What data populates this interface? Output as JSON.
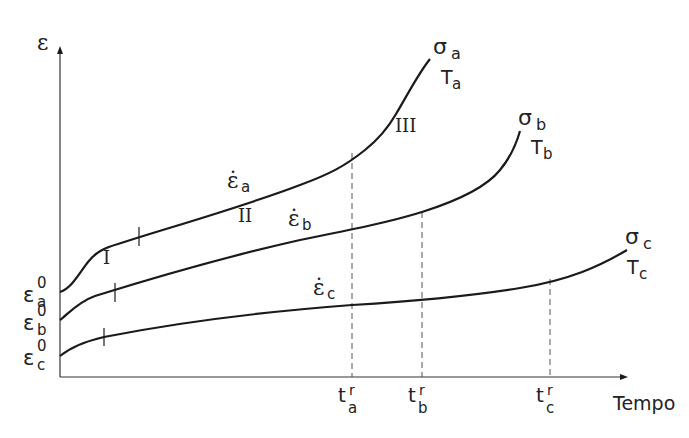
{
  "axes": {
    "y_label": "ε",
    "x_label": "Tempo"
  },
  "curves": [
    {
      "id": "a",
      "stress_label": "σ",
      "stress_sub": "a",
      "temp_label": "T",
      "temp_sub": "a",
      "initial_strain_label": "ε",
      "initial_strain_sub": "a",
      "initial_strain_sup": "0",
      "rate_label": "ε̇",
      "rate_sub": "a",
      "rupture_label": "t",
      "rupture_sub": "a",
      "rupture_sup": "r"
    },
    {
      "id": "b",
      "stress_label": "σ",
      "stress_sub": "b",
      "temp_label": "T",
      "temp_sub": "b",
      "initial_strain_label": "ε",
      "initial_strain_sub": "b",
      "initial_strain_sup": "0",
      "rate_label": "ε̇",
      "rate_sub": "b",
      "rupture_label": "t",
      "rupture_sub": "b",
      "rupture_sup": "r"
    },
    {
      "id": "c",
      "stress_label": "σ",
      "stress_sub": "c",
      "temp_label": "T",
      "temp_sub": "c",
      "initial_strain_label": "ε",
      "initial_strain_sub": "c",
      "initial_strain_sup": "0",
      "rate_label": "ε̇",
      "rate_sub": "c",
      "rupture_label": "t",
      "rupture_sub": "c",
      "rupture_sup": "r"
    }
  ],
  "stages": {
    "primary": "I",
    "secondary": "II",
    "tertiary": "III"
  },
  "colors": {
    "line": "#1a1a1a",
    "text": "#222222",
    "dashed": "#555555"
  }
}
